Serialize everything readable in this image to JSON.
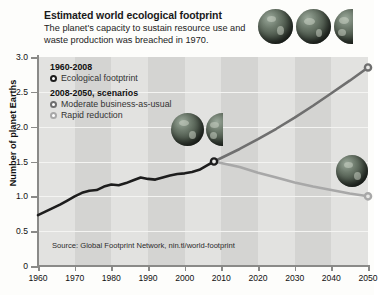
{
  "header": {
    "title": "Estimated world ecological footprint",
    "subtitle": "The planet's capacity to sustain resource use and waste production was breached in 1970."
  },
  "legend": {
    "group1_title": "1960-2008",
    "group1_item": "Ecological footptrint",
    "group2_title": "2008-2050, scenarios",
    "group2_item1": "Moderate business-as-usual",
    "group2_item2": "Rapid reduction"
  },
  "source": "Source: Global Footprint Network, nin.tl/world-footprint",
  "axes": {
    "y_title": "Number of planet Earths",
    "y_ticks": [
      "3.0",
      "2.5",
      "2.0",
      "1.5",
      "1.0",
      "0.5",
      "0"
    ],
    "x_ticks": [
      "1960",
      "1970",
      "1980",
      "1990",
      "2000",
      "2010",
      "2020",
      "2030",
      "2040",
      "2050"
    ]
  },
  "colors": {
    "historical_line": "#1d1d1d",
    "business_as_usual_line": "#6f6f6f",
    "rapid_reduction_line": "#a8a8a8",
    "plot_background": "#e2e2e0",
    "band": "#d4d4d2",
    "gridline": "#f4f4f2",
    "axis": "#8a8a88"
  },
  "chart_data": {
    "type": "line",
    "title": "Estimated world ecological footprint",
    "subtitle": "The planet's capacity to sustain resource use and waste production was breached in 1970.",
    "xlabel": "",
    "ylabel": "Number of planet Earths",
    "xlim": [
      1960,
      2050
    ],
    "ylim": [
      0,
      3.0
    ],
    "ytick_step": 0.5,
    "grid": "horizontal",
    "legend_position": "upper-left-inside",
    "annotations": [
      "The planet's capacity (1.0 Earth) was breached in 1970",
      "Globes above the lines illustrate the number of planet Earths required"
    ],
    "series": [
      {
        "name": "Ecological footptrint",
        "period": "1960-2008",
        "color": "#1d1d1d",
        "x": [
          1960,
          1962,
          1964,
          1966,
          1968,
          1970,
          1972,
          1974,
          1976,
          1978,
          1980,
          1982,
          1984,
          1986,
          1988,
          1990,
          1992,
          1994,
          1996,
          1998,
          2000,
          2002,
          2004,
          2006,
          2008
        ],
        "y": [
          0.73,
          0.78,
          0.83,
          0.88,
          0.94,
          1.0,
          1.05,
          1.08,
          1.09,
          1.14,
          1.17,
          1.16,
          1.19,
          1.23,
          1.27,
          1.25,
          1.24,
          1.27,
          1.3,
          1.32,
          1.33,
          1.35,
          1.38,
          1.44,
          1.5
        ]
      },
      {
        "name": "Moderate business-as-usual",
        "period": "2008-2050",
        "color": "#6f6f6f",
        "x": [
          2008,
          2015,
          2020,
          2025,
          2030,
          2035,
          2040,
          2045,
          2050
        ],
        "y": [
          1.5,
          1.68,
          1.82,
          1.97,
          2.13,
          2.3,
          2.48,
          2.66,
          2.85
        ]
      },
      {
        "name": "Rapid reduction",
        "period": "2008-2050",
        "color": "#a8a8a8",
        "x": [
          2008,
          2015,
          2020,
          2025,
          2030,
          2035,
          2040,
          2045,
          2050
        ],
        "y": [
          1.5,
          1.42,
          1.34,
          1.27,
          1.2,
          1.14,
          1.09,
          1.04,
          1.0
        ]
      }
    ],
    "endpoint_markers": [
      {
        "series": "Ecological footptrint",
        "x": 2008,
        "y": 1.5
      },
      {
        "series": "Moderate business-as-usual",
        "x": 2050,
        "y": 2.85
      },
      {
        "series": "Rapid reduction",
        "x": 2050,
        "y": 1.0
      }
    ],
    "globe_icons": [
      {
        "label": "2.85 Earths",
        "position": "top-right",
        "full_globes": 2,
        "partial_globes": 1
      },
      {
        "label": "1.5 Earths",
        "position": "mid-plot at 2008",
        "full_globes": 1,
        "partial_globes": 1
      },
      {
        "label": "1.0 Earth",
        "position": "lower-right at 2050",
        "full_globes": 1,
        "partial_globes": 0
      }
    ]
  }
}
